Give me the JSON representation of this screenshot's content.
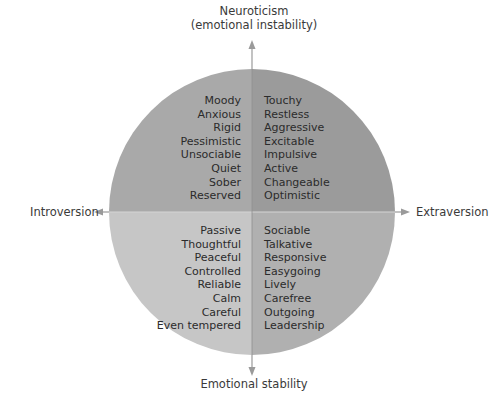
{
  "axes": {
    "top_line1": "Neuroticism",
    "top_line2": "(emotional instability)",
    "bottom": "Emotional stability",
    "left": "Introversion",
    "right": "Extraversion"
  },
  "quadrants": {
    "top_left": {
      "position": "introversion-neuroticism",
      "color": "#a9a9a9",
      "traits": [
        "Moody",
        "Anxious",
        "Rigid",
        "Pessimistic",
        "Unsociable",
        "Quiet",
        "Sober",
        "Reserved"
      ]
    },
    "top_right": {
      "position": "extraversion-neuroticism",
      "color": "#9b9b9b",
      "traits": [
        "Touchy",
        "Restless",
        "Aggressive",
        "Excitable",
        "Impulsive",
        "Active",
        "Changeable",
        "Optimistic"
      ]
    },
    "bottom_left": {
      "position": "introversion-stability",
      "color": "#c6c6c6",
      "traits": [
        "Passive",
        "Thoughtful",
        "Peaceful",
        "Controlled",
        "Reliable",
        "Calm",
        "Careful",
        "Even tempered"
      ]
    },
    "bottom_right": {
      "position": "extraversion-stability",
      "color": "#b0b0b0",
      "traits": [
        "Sociable",
        "Talkative",
        "Responsive",
        "Easygoing",
        "Lively",
        "Carefree",
        "Outgoing",
        "Leadership"
      ]
    }
  },
  "colors": {
    "arrow": "#9a9a9a",
    "divider": "#d8d8d8",
    "text": "#2b2b2b"
  }
}
